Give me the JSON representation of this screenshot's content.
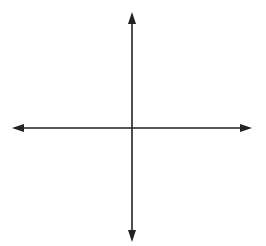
{
  "diagram": {
    "type": "coordinate-plane",
    "axes": {
      "x_label": "x",
      "y_label": "y",
      "origin_label": "0"
    },
    "grid": {
      "x_min": -8,
      "x_max": 8,
      "y_min": -8,
      "y_max": 8,
      "cell_px": 12,
      "color": "#cccccc"
    },
    "points": [
      {
        "name": "A",
        "x": 3,
        "y": 6,
        "coords": "(3, 6)",
        "label_side": "right"
      },
      {
        "name": "B",
        "x": -3,
        "y": 2,
        "coords": "(−3, 2)",
        "label_side": "left-above"
      },
      {
        "name": "C",
        "x": 5,
        "y": -1,
        "coords": "(5, −1)",
        "label_side": "right"
      },
      {
        "name": "D",
        "x": -3,
        "y": -3,
        "coords": "(−3, −3)",
        "label_side": "left-below"
      },
      {
        "name": "E",
        "x": 2,
        "y": 0,
        "coords": "(2, 0)",
        "label_side": "right-above"
      },
      {
        "name": "F",
        "x": 0,
        "y": -4,
        "coords": "(0, −4)",
        "label_side": "right"
      }
    ]
  }
}
